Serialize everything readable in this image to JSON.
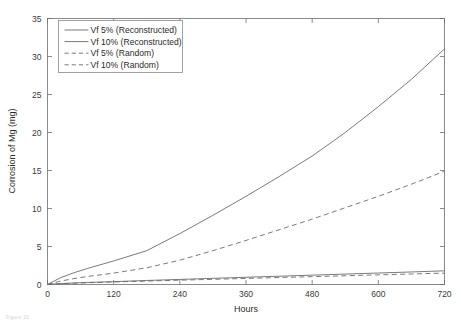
{
  "figure": {
    "caption_fragment": "Figure 10."
  },
  "chart_data": {
    "type": "line",
    "title": "",
    "subtitle": "",
    "xlabel": "Hours",
    "ylabel": "Corrosion of Mg (mg)",
    "xlim": [
      0,
      720
    ],
    "ylim": [
      0,
      35
    ],
    "xticks": [
      0,
      120,
      240,
      360,
      480,
      600,
      720
    ],
    "xtick_labels": [
      "0",
      "120",
      "240",
      "360",
      "480",
      "600",
      "720"
    ],
    "yticks": [
      0,
      5,
      10,
      15,
      20,
      25,
      30,
      35
    ],
    "ytick_labels": [
      "0",
      "5",
      "10",
      "15",
      "20",
      "25",
      "30",
      "35"
    ],
    "grid": false,
    "box": true,
    "legend_position": "upper-left-inside",
    "line_color": "#6b6b6b",
    "x": [
      0,
      24,
      48,
      72,
      120,
      180,
      240,
      300,
      360,
      420,
      480,
      540,
      600,
      660,
      720
    ],
    "series": [
      {
        "name": "Vf 5% (Reconstructed)",
        "style": "solid",
        "values": [
          0,
          0.12,
          0.2,
          0.27,
          0.38,
          0.53,
          0.67,
          0.81,
          0.95,
          1.09,
          1.23,
          1.37,
          1.51,
          1.65,
          1.8
        ]
      },
      {
        "name": "Vf 10% (Reconstructed)",
        "style": "solid",
        "values": [
          0,
          0.9,
          1.55,
          2.1,
          3.1,
          4.45,
          6.7,
          9.1,
          11.6,
          14.2,
          16.9,
          20.0,
          23.4,
          27.0,
          31.0
        ]
      },
      {
        "name": "Vf 5% (Random)",
        "style": "dashed",
        "values": [
          0,
          0.1,
          0.17,
          0.23,
          0.33,
          0.45,
          0.57,
          0.68,
          0.8,
          0.92,
          1.03,
          1.15,
          1.27,
          1.38,
          1.5
        ]
      },
      {
        "name": "Vf 10% (Random)",
        "style": "dashed",
        "values": [
          0,
          0.45,
          0.78,
          1.05,
          1.5,
          2.2,
          3.2,
          4.45,
          5.8,
          7.2,
          8.6,
          10.1,
          11.6,
          13.2,
          14.9
        ]
      }
    ],
    "legend": [
      {
        "label": "Vf 5% (Reconstructed)",
        "style": "solid"
      },
      {
        "label": "Vf 10% (Reconstructed)",
        "style": "solid"
      },
      {
        "label": "Vf 5% (Random)",
        "style": "dashed"
      },
      {
        "label": "Vf 10% (Random)",
        "style": "dashed"
      }
    ]
  }
}
